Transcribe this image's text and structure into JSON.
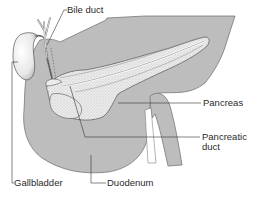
{
  "colors": {
    "organ_fill": "#bdbdbd",
    "outline": "#555555",
    "pancreas_fill": "#ececec",
    "gallbladder_fill": "#f4f4f4",
    "leader_line": "#333333",
    "text": "#2a2a2a"
  },
  "labels": {
    "bile_duct": "Bile duct",
    "pancreas": "Pancreas",
    "pancreatic_duct_line1": "Pancreatic",
    "pancreatic_duct_line2": "duct",
    "gallbladder": "Gallbladder",
    "duodenum": "Duodenum"
  }
}
